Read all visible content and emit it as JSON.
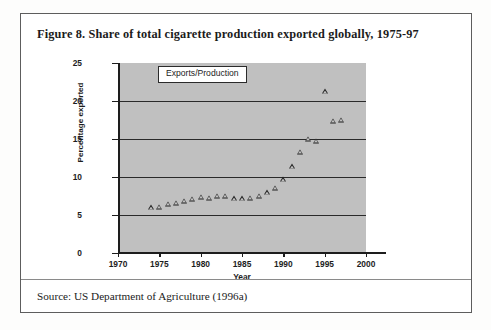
{
  "figure": {
    "title": "Figure 8. Share of total cigarette production exported globally, 1975-97",
    "source": "Source: US Department of Agriculture (1996a)"
  },
  "chart_data": {
    "type": "scatter",
    "title": "",
    "xlabel": "Year",
    "ylabel": "Percentage exported",
    "xlim": [
      1970,
      2000
    ],
    "ylim": [
      0,
      25
    ],
    "xticks": [
      1970,
      1975,
      1980,
      1985,
      1990,
      1995,
      2000
    ],
    "yticks": [
      0,
      5,
      10,
      15,
      20,
      25
    ],
    "xtick_labels": [
      "1970",
      "1975",
      "1980",
      "1985",
      "1990",
      "1995",
      "2000"
    ],
    "ytick_labels": [
      "0",
      "5",
      "10",
      "15",
      "20",
      "25"
    ],
    "grid": "horizontal",
    "plot_background": "#c0c0c0",
    "marker": "triangle-up-open",
    "marker_color": "#1f1f1f",
    "legend": {
      "position": "top-center-inside",
      "entries": [
        "Exports/Production"
      ]
    },
    "series": [
      {
        "name": "Exports/Production",
        "points": [
          {
            "x": 1974,
            "y": 6.0
          },
          {
            "x": 1975,
            "y": 6.1
          },
          {
            "x": 1976,
            "y": 6.5
          },
          {
            "x": 1977,
            "y": 6.6
          },
          {
            "x": 1978,
            "y": 6.9
          },
          {
            "x": 1979,
            "y": 7.1
          },
          {
            "x": 1980,
            "y": 7.4
          },
          {
            "x": 1981,
            "y": 7.3
          },
          {
            "x": 1982,
            "y": 7.5
          },
          {
            "x": 1983,
            "y": 7.5
          },
          {
            "x": 1984,
            "y": 7.2
          },
          {
            "x": 1985,
            "y": 7.2
          },
          {
            "x": 1986,
            "y": 7.3
          },
          {
            "x": 1987,
            "y": 7.5
          },
          {
            "x": 1988,
            "y": 8.0
          },
          {
            "x": 1989,
            "y": 8.6
          },
          {
            "x": 1990,
            "y": 9.7
          },
          {
            "x": 1991,
            "y": 11.4
          },
          {
            "x": 1992,
            "y": 13.3
          },
          {
            "x": 1993,
            "y": 15.0
          },
          {
            "x": 1994,
            "y": 14.8
          },
          {
            "x": 1995,
            "y": 21.3
          },
          {
            "x": 1996,
            "y": 17.4
          },
          {
            "x": 1997,
            "y": 17.5
          }
        ]
      }
    ]
  }
}
